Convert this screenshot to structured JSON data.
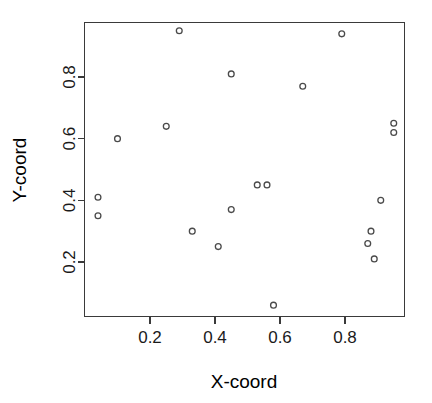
{
  "chart_data": {
    "type": "scatter",
    "title": "",
    "xlabel": "X-coord",
    "ylabel": "Y-coord",
    "xlim": [
      0.02,
      0.99
    ],
    "ylim": [
      0.03,
      0.97
    ],
    "xticks": [
      0.2,
      0.4,
      0.6,
      0.8
    ],
    "xticklabels": [
      "0.2",
      "0.4",
      "0.6",
      "0.8"
    ],
    "yticks": [
      0.2,
      0.4,
      0.6,
      0.8
    ],
    "yticklabels": [
      "0.2",
      "0.4",
      "0.6",
      "0.8"
    ],
    "grid": false,
    "legend": null,
    "marker": "open-circle",
    "marker_color": "#4a4a4a",
    "points": [
      {
        "x": 0.29,
        "y": 0.95
      },
      {
        "x": 0.79,
        "y": 0.94
      },
      {
        "x": 0.45,
        "y": 0.81
      },
      {
        "x": 0.67,
        "y": 0.77
      },
      {
        "x": 0.25,
        "y": 0.64
      },
      {
        "x": 0.95,
        "y": 0.65
      },
      {
        "x": 0.95,
        "y": 0.62
      },
      {
        "x": 0.1,
        "y": 0.6
      },
      {
        "x": 0.53,
        "y": 0.45
      },
      {
        "x": 0.56,
        "y": 0.45
      },
      {
        "x": 0.04,
        "y": 0.41
      },
      {
        "x": 0.91,
        "y": 0.4
      },
      {
        "x": 0.45,
        "y": 0.37
      },
      {
        "x": 0.04,
        "y": 0.35
      },
      {
        "x": 0.33,
        "y": 0.3
      },
      {
        "x": 0.88,
        "y": 0.3
      },
      {
        "x": 0.87,
        "y": 0.26
      },
      {
        "x": 0.41,
        "y": 0.25
      },
      {
        "x": 0.89,
        "y": 0.21
      },
      {
        "x": 0.58,
        "y": 0.06
      }
    ]
  },
  "axes": {
    "x_title": "X-coord",
    "y_title": "Y-coord"
  },
  "colors": {
    "axis": "#3a3a3a",
    "text": "#000000",
    "marker": "#4a4a4a",
    "background": "#ffffff"
  }
}
